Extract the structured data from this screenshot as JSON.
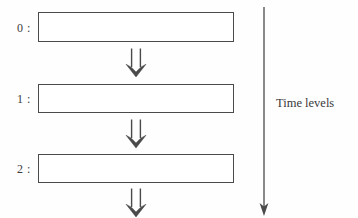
{
  "figure": {
    "background_color": "#fefefe",
    "stroke_color": "#4a4a4a",
    "text_color": "#3c3c3c"
  },
  "levels": [
    {
      "label": "0 :",
      "label_x": 17,
      "label_y": 22,
      "box_x": 38,
      "box_y": 12,
      "box_w": 196,
      "box_h": 30
    },
    {
      "label": "1 :",
      "label_x": 17,
      "label_y": 93,
      "box_x": 38,
      "box_y": 84,
      "box_w": 196,
      "box_h": 29
    },
    {
      "label": "2 :",
      "label_x": 17,
      "label_y": 163,
      "box_x": 38,
      "box_y": 154,
      "box_w": 196,
      "box_h": 29
    }
  ],
  "transitions": [
    {
      "name": "arrow-level-0-to-1",
      "glyph": "double-down-arrow",
      "x": 125,
      "y": 48
    },
    {
      "name": "arrow-level-1-to-2",
      "glyph": "double-down-arrow",
      "x": 125,
      "y": 119
    },
    {
      "name": "arrow-level-2-to-next",
      "glyph": "double-down-arrow",
      "x": 125,
      "y": 188
    }
  ],
  "time_axis": {
    "label": "Time levels",
    "label_x": 276,
    "label_y": 97,
    "line_x": 264,
    "line_top": 7,
    "line_bottom": 208,
    "direction": "downwards"
  }
}
